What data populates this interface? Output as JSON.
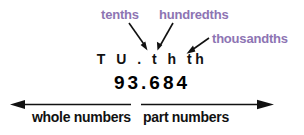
{
  "diagram": {
    "background_color": "#ffffff",
    "accent_color": "#8d74b3",
    "text_color": "#111111"
  },
  "callouts": [
    {
      "id": "tenths",
      "label": "tenths",
      "points_to": "t"
    },
    {
      "id": "hundredths",
      "label": "hundredths",
      "points_to": "h"
    },
    {
      "id": "thousandths",
      "label": "thousandths",
      "points_to": "th"
    }
  ],
  "place_value_row": {
    "text": "T U . t h th",
    "symbols": [
      "T",
      "U",
      ".",
      "t",
      "h",
      "th"
    ],
    "meanings": [
      "tens",
      "units",
      "decimal point",
      "tenths",
      "hundredths",
      "thousandths"
    ]
  },
  "number_row": {
    "text": "93.684",
    "value": "93.684",
    "digits": [
      "9",
      "3",
      ".",
      "6",
      "8",
      "4"
    ],
    "whole_part": "93",
    "decimal_part": "684"
  },
  "captions": {
    "left": "whole numbers",
    "right": "part numbers"
  },
  "axis": {
    "left_arrow": "arrow-left",
    "right_arrow": "arrow-right",
    "divider": "decimal-point-divider"
  }
}
